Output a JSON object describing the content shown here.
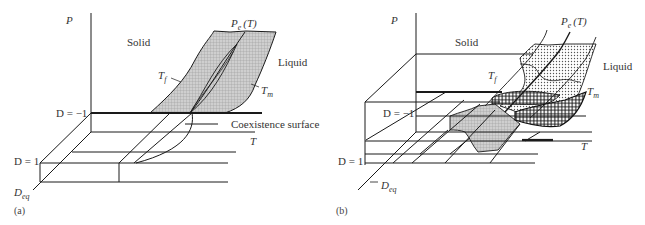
{
  "figure": {
    "panels": [
      {
        "id": "a",
        "caption": "(a)",
        "axes": {
          "p_label": "P",
          "t_label": "T",
          "d_label": "D",
          "d_sub": "eq"
        },
        "d_levels": [
          "D = −1",
          "D = 1"
        ],
        "regions": {
          "solid": "Solid",
          "liquid": "Liquid"
        },
        "curves": {
          "pe": "P",
          "pe_sub": "e",
          "pe_arg": "(T)",
          "tf": "T",
          "tf_sub": "f",
          "tm": "T",
          "tm_sub": "m"
        },
        "annotation": "Coexistence surface"
      },
      {
        "id": "b",
        "caption": "(b)",
        "axes": {
          "p_label": "P",
          "t_label": "T",
          "d_label": "D",
          "d_sub": "eq"
        },
        "d_levels": [
          "D = −1",
          "D = 1"
        ],
        "regions": {
          "solid": "Solid",
          "liquid": "Liquid"
        },
        "curves": {
          "pe": "P",
          "pe_sub": "e",
          "pe_arg": "(T)",
          "tf": "T",
          "tf_sub": "f",
          "tm": "T",
          "tm_sub": "m"
        }
      }
    ],
    "colors": {
      "line": "#1a1a1a",
      "shade": "#b8b8b8",
      "text": "#333333"
    }
  }
}
